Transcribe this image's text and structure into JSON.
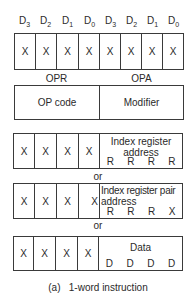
{
  "bit_labels": [
    {
      "letter": "D",
      "sub": "3"
    },
    {
      "letter": "D",
      "sub": "2"
    },
    {
      "letter": "D",
      "sub": "1"
    },
    {
      "letter": "D",
      "sub": "0"
    },
    {
      "letter": "D",
      "sub": "3"
    },
    {
      "letter": "D",
      "sub": "2"
    },
    {
      "letter": "D",
      "sub": "1"
    },
    {
      "letter": "D",
      "sub": "0"
    }
  ],
  "top_row_cells": [
    "X",
    "X",
    "X",
    "X",
    "X",
    "X",
    "X",
    "X"
  ],
  "section_labels": {
    "left": "OPR",
    "right": "OPA"
  },
  "opcode_box": {
    "left": "OP code",
    "right": "Modifier"
  },
  "format_index_register": {
    "cells": [
      "X",
      "X",
      "X",
      "X"
    ],
    "title_line1": "Index register",
    "title_line2": "address",
    "letters": [
      "R",
      "R",
      "R",
      "R"
    ]
  },
  "separator_1": "or",
  "format_index_register_pair": {
    "cells": [
      "X",
      "X",
      "X",
      "X"
    ],
    "title_line1": "Index register pair",
    "title_line2": "address",
    "letters": [
      "R",
      "R",
      "R",
      "X"
    ]
  },
  "separator_2": "or",
  "format_data": {
    "cells": [
      "X",
      "X",
      "X",
      "X"
    ],
    "title_line1": "Data",
    "letters": [
      "D",
      "D",
      "D",
      "D"
    ]
  },
  "caption": "(a)   1-word instruction"
}
